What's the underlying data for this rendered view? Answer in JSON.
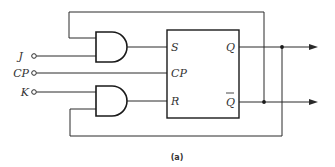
{
  "diagram": {
    "type": "JK flip-flop logic circuit",
    "caption": "(a)",
    "inputs": [
      {
        "id": "J",
        "label": "J"
      },
      {
        "id": "CP",
        "label": "CP"
      },
      {
        "id": "K",
        "label": "K"
      }
    ],
    "block": {
      "pins_left": [
        "S",
        "CP",
        "R"
      ],
      "pins_right": [
        "Q",
        "Q"
      ],
      "q_bar_overline": true
    },
    "gates": [
      {
        "id": "and-top",
        "type": "AND",
        "inputs": [
          "Q-bar feedback",
          "J"
        ],
        "output": "S"
      },
      {
        "id": "and-bottom",
        "type": "AND",
        "inputs": [
          "K",
          "Q feedback"
        ],
        "output": "R"
      }
    ],
    "outputs": [
      "Q",
      "Q-bar"
    ],
    "colors": {
      "line": "#2a2a2a",
      "background": "#ffffff"
    }
  }
}
